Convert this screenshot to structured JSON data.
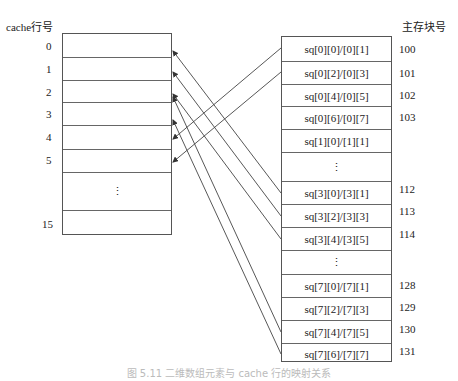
{
  "cache": {
    "title": "cache行号",
    "rows": [
      {
        "index": "0",
        "content": ""
      },
      {
        "index": "1",
        "content": ""
      },
      {
        "index": "2",
        "content": ""
      },
      {
        "index": "3",
        "content": ""
      },
      {
        "index": "4",
        "content": ""
      },
      {
        "index": "5",
        "content": ""
      },
      {
        "index": "",
        "content": "⋮"
      },
      {
        "index": "15",
        "content": ""
      }
    ]
  },
  "memory": {
    "title": "主存块号",
    "rows": [
      {
        "block": "100",
        "content": "sq[0][0]/[0][1]"
      },
      {
        "block": "101",
        "content": "sq[0][2]/[0][3]"
      },
      {
        "block": "102",
        "content": "sq[0][4]/[0][5]"
      },
      {
        "block": "103",
        "content": "sq[0][6]/[0][7]"
      },
      {
        "block": "",
        "content": "sq[1][0]/[1][1]"
      },
      {
        "block": "",
        "content": "⋮"
      },
      {
        "block": "112",
        "content": "sq[3][0]/[3][1]"
      },
      {
        "block": "113",
        "content": "sq[3][2]/[3][3]"
      },
      {
        "block": "114",
        "content": "sq[3][4]/[3][5]"
      },
      {
        "block": "",
        "content": "⋮"
      },
      {
        "block": "128",
        "content": "sq[7][0]/[7][1]"
      },
      {
        "block": "129",
        "content": "sq[7][2]/[7][3]"
      },
      {
        "block": "130",
        "content": "sq[7][4]/[7][5]"
      },
      {
        "block": "131",
        "content": "sq[7][6]/[7][7]"
      }
    ]
  },
  "mappings": [
    {
      "from": "100",
      "to_cache_line": "4"
    },
    {
      "from": "101",
      "to_cache_line": "5"
    },
    {
      "from": "112",
      "to_cache_line": "0"
    },
    {
      "from": "113",
      "to_cache_line": "1"
    },
    {
      "from": "114",
      "to_cache_line": "2"
    },
    {
      "from": "130",
      "to_cache_line": "2"
    },
    {
      "from": "131",
      "to_cache_line": "3"
    }
  ],
  "caption": "图 5.11  二维数组元素与 cache 行的映射关系"
}
